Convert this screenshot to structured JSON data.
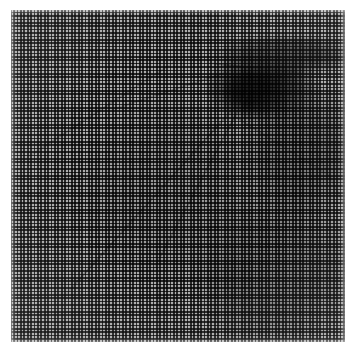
{
  "image": {
    "title": "Halftone screen print scan",
    "description": "Scanned grayscale halftone print: a fine orthogonal dot screen over a faint photographic image with diagonal ridge lines and a dense dark patch in the upper right",
    "width": 356,
    "height": 355,
    "background_color": "#ffffff"
  },
  "print": {
    "left": 11,
    "top": 10,
    "width": 334,
    "height": 332,
    "base_color": "#c9c9c9",
    "ink_color": "#1c1c1c",
    "paper_color": "#f2f2f2"
  },
  "screen": {
    "type": "orthogonal-halftone",
    "cell_pitch_px": 3.4,
    "line_width_px": 1.7,
    "angle_degrees": 0,
    "dot_color": "#262626",
    "gap_color": "#ededed"
  },
  "tone_regions": [
    {
      "name": "dark-patch-upper-right",
      "cx": 262,
      "cy": 88,
      "rx": 56,
      "ry": 34,
      "value": 0.8,
      "color": "#2e2e2e"
    },
    {
      "name": "dark-patch-core",
      "cx": 256,
      "cy": 92,
      "rx": 32,
      "ry": 22,
      "value": 0.92,
      "color": "#1e1e1e"
    },
    {
      "name": "dark-band-top-right",
      "cx": 285,
      "cy": 55,
      "rx": 70,
      "ry": 20,
      "value": 0.62,
      "color": "#444444"
    },
    {
      "name": "mid-shade-right",
      "cx": 300,
      "cy": 150,
      "rx": 60,
      "ry": 70,
      "value": 0.46,
      "color": "#6a6a6a"
    },
    {
      "name": "mid-shade-lower-right",
      "cx": 275,
      "cy": 270,
      "rx": 85,
      "ry": 80,
      "value": 0.4,
      "color": "#767676"
    },
    {
      "name": "light-field-upper-left",
      "cx": 85,
      "cy": 95,
      "rx": 85,
      "ry": 80,
      "value": 0.18,
      "color": "#c6c6c6"
    },
    {
      "name": "light-field-lower-left",
      "cx": 80,
      "cy": 265,
      "rx": 80,
      "ry": 85,
      "value": 0.22,
      "color": "#bdbdbd"
    },
    {
      "name": "mid-field-center",
      "cx": 175,
      "cy": 190,
      "rx": 95,
      "ry": 95,
      "value": 0.33,
      "color": "#9a9a9a"
    }
  ],
  "ridges": [
    {
      "name": "main-diagonal-ridge",
      "x": 60,
      "y": 300,
      "length": 270,
      "angle": -48,
      "thickness": 2,
      "tone": "#5f5f5f",
      "opacity": 0.55
    },
    {
      "name": "secondary-diagonal-ridge",
      "x": 150,
      "y": 275,
      "length": 215,
      "angle": -62,
      "thickness": 2,
      "tone": "#5a5a5a",
      "opacity": 0.5
    },
    {
      "name": "upper-left-diagonal-ridge",
      "x": 22,
      "y": 160,
      "length": 190,
      "angle": -33,
      "thickness": 2,
      "tone": "#6a6a6a",
      "opacity": 0.45
    },
    {
      "name": "upper-arc-ridge",
      "x": 108,
      "y": 110,
      "length": 140,
      "angle": -18,
      "thickness": 2,
      "tone": "#646464",
      "opacity": 0.42
    },
    {
      "name": "right-descending-ridge",
      "x": 226,
      "y": 110,
      "length": 130,
      "angle": 32,
      "thickness": 2,
      "tone": "#5e5e5e",
      "opacity": 0.45
    },
    {
      "name": "right-edge-ridge",
      "x": 300,
      "y": 120,
      "length": 110,
      "angle": 62,
      "thickness": 2,
      "tone": "#666666",
      "opacity": 0.35
    },
    {
      "name": "vertical-ridge-lower-center",
      "x": 156,
      "y": 238,
      "length": 100,
      "angle": 88,
      "thickness": 2,
      "tone": "#6b6b6b",
      "opacity": 0.38
    },
    {
      "name": "patch-edge-ridge",
      "x": 208,
      "y": 62,
      "length": 95,
      "angle": 6,
      "thickness": 2,
      "tone": "#3a3a3a",
      "opacity": 0.5
    }
  ],
  "metrics": {
    "cells_horizontal": 98,
    "cells_vertical": 98,
    "margin_left_px": 11,
    "margin_top_px": 10,
    "margin_right_px": 11,
    "margin_bottom_px": 13
  }
}
